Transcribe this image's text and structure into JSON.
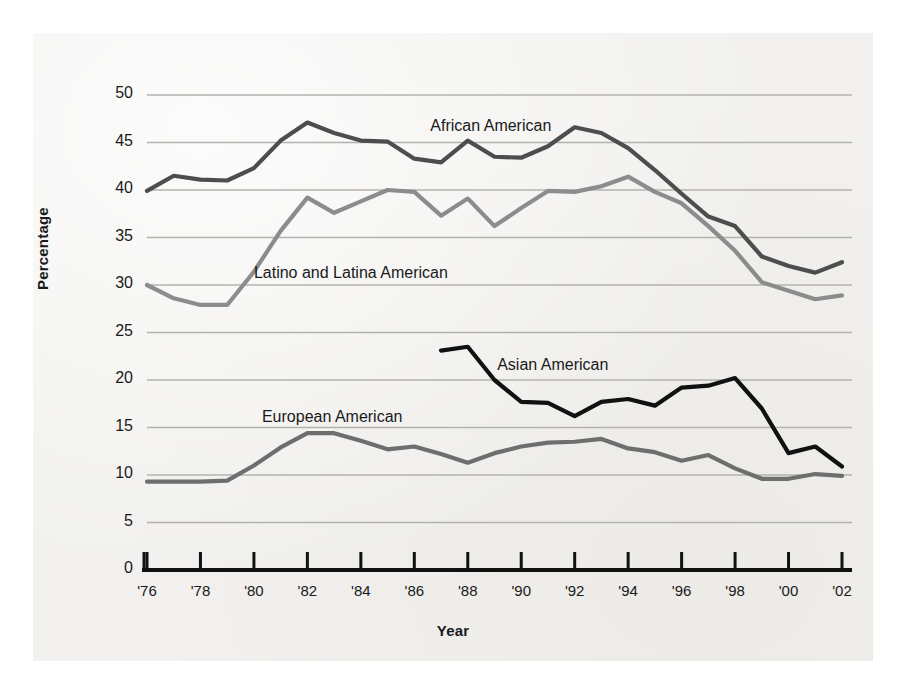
{
  "chart_data": {
    "type": "line",
    "title": "",
    "xlabel": "Year",
    "ylabel": "Percentage",
    "xlim": [
      1976,
      2002
    ],
    "ylim": [
      0,
      50
    ],
    "grid": true,
    "legend_position": "inline-labels",
    "x": [
      1976,
      1977,
      1978,
      1979,
      1980,
      1981,
      1982,
      1983,
      1984,
      1985,
      1986,
      1987,
      1988,
      1989,
      1990,
      1991,
      1992,
      1993,
      1994,
      1995,
      1996,
      1997,
      1998,
      1999,
      2000,
      2001,
      2002
    ],
    "xtick_labels": [
      "'76",
      "'78",
      "'80",
      "'82",
      "'84",
      "'86",
      "'88",
      "'90",
      "'92",
      "'94",
      "'96",
      "'98",
      "'00",
      "'02"
    ],
    "xtick_values": [
      1976,
      1978,
      1980,
      1982,
      1984,
      1986,
      1988,
      1990,
      1992,
      1994,
      1996,
      1998,
      2000,
      2002
    ],
    "ytick_labels": [
      "0",
      "5",
      "10",
      "15",
      "20",
      "25",
      "30",
      "35",
      "40",
      "45",
      "50"
    ],
    "ytick_values": [
      0,
      5,
      10,
      15,
      20,
      25,
      30,
      35,
      40,
      45,
      50
    ],
    "series": [
      {
        "name": "African American",
        "color": "#4d4d4d",
        "label_x": 1986.6,
        "label_y": 46.6,
        "x": [
          1976,
          1977,
          1978,
          1979,
          1980,
          1981,
          1982,
          1983,
          1984,
          1985,
          1986,
          1987,
          1988,
          1989,
          1990,
          1991,
          1992,
          1993,
          1994,
          1995,
          1996,
          1997,
          1998,
          1999,
          2000,
          2001,
          2002
        ],
        "values": [
          39.9,
          41.5,
          41.1,
          41.0,
          42.3,
          45.2,
          47.1,
          46.0,
          45.2,
          45.1,
          43.3,
          42.9,
          45.2,
          43.5,
          43.4,
          44.6,
          46.6,
          46.0,
          44.4,
          42.1,
          39.6,
          37.2,
          36.2,
          33.0,
          32.0,
          31.3,
          32.4
        ]
      },
      {
        "name": "Latino and Latina American",
        "color": "#8c8c8c",
        "label_x": 1980.0,
        "label_y": 31.2,
        "x": [
          1976,
          1977,
          1978,
          1979,
          1980,
          1981,
          1982,
          1983,
          1984,
          1985,
          1986,
          1987,
          1988,
          1989,
          1990,
          1991,
          1992,
          1993,
          1994,
          1995,
          1996,
          1997,
          1998,
          1999,
          2000,
          2001,
          2002
        ],
        "values": [
          30.0,
          28.6,
          27.9,
          27.9,
          31.4,
          35.7,
          39.2,
          37.6,
          38.8,
          40.0,
          39.8,
          37.3,
          39.1,
          36.2,
          38.1,
          39.9,
          39.8,
          40.4,
          41.4,
          39.8,
          38.6,
          36.2,
          33.6,
          30.3,
          29.4,
          28.5,
          28.9
        ]
      },
      {
        "name": "Asian American",
        "color": "#111111",
        "label_x": 1989.1,
        "label_y": 21.5,
        "x": [
          1987,
          1988,
          1989,
          1990,
          1991,
          1992,
          1993,
          1994,
          1995,
          1996,
          1997,
          1998,
          1999,
          2000,
          2001,
          2002
        ],
        "values": [
          23.1,
          23.5,
          20.0,
          17.7,
          17.6,
          16.2,
          17.7,
          18.0,
          17.3,
          19.2,
          19.4,
          20.2,
          17.0,
          12.3,
          13.0,
          10.9
        ]
      },
      {
        "name": "European American",
        "color": "#6e6e6e",
        "label_x": 1980.3,
        "label_y": 16.0,
        "x": [
          1976,
          1977,
          1978,
          1979,
          1980,
          1981,
          1982,
          1983,
          1984,
          1985,
          1986,
          1987,
          1988,
          1989,
          1990,
          1991,
          1992,
          1993,
          1994,
          1995,
          1996,
          1997,
          1998,
          1999,
          2000,
          2001,
          2002
        ],
        "values": [
          9.3,
          9.3,
          9.3,
          9.4,
          11.0,
          12.9,
          14.4,
          14.4,
          13.6,
          12.7,
          13.0,
          12.2,
          11.3,
          12.3,
          13.0,
          13.4,
          13.5,
          13.8,
          12.8,
          12.4,
          11.5,
          12.1,
          10.7,
          9.6,
          9.6,
          10.1,
          9.9
        ]
      }
    ]
  },
  "axes": {
    "y_title": "Percentage",
    "x_title": "Year"
  }
}
